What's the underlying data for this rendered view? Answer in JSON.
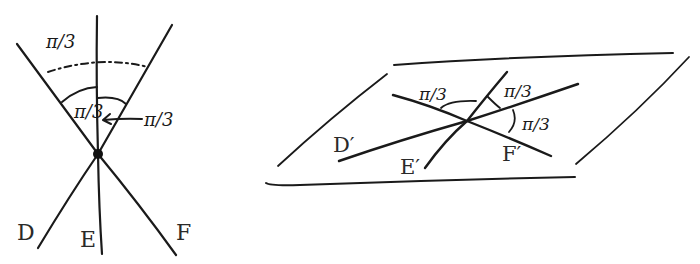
{
  "figure_left": {
    "labels": {
      "line_d": "D",
      "line_e": "E",
      "line_f": "F"
    },
    "angles": {
      "outer_arc": "π/3",
      "inner_left": "π/3",
      "inner_right": "π/3"
    }
  },
  "figure_right": {
    "labels": {
      "line_d_prime": "D′",
      "line_e_prime": "E′",
      "line_f_prime": "F′"
    },
    "angles": {
      "left": "π/3",
      "top_right": "π/3",
      "right": "π/3"
    }
  },
  "colors": {
    "ink": "#1a1a1a",
    "background": "#ffffff"
  }
}
